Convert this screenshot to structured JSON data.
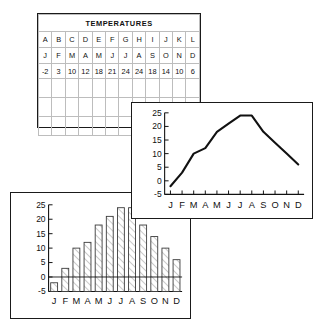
{
  "table": {
    "title": "TEMPERATURES",
    "column_letters": [
      "A",
      "B",
      "C",
      "D",
      "E",
      "F",
      "G",
      "H",
      "I",
      "J",
      "K",
      "L"
    ],
    "month_row": [
      "J",
      "F",
      "M",
      "A",
      "M",
      "J",
      "J",
      "A",
      "S",
      "O",
      "N",
      "D"
    ],
    "value_row": [
      "-2",
      "3",
      "10",
      "12",
      "18",
      "21",
      "24",
      "24",
      "18",
      "14",
      "10",
      "6"
    ],
    "blank_rows": 3
  },
  "chart_data": [
    {
      "type": "line",
      "title": "",
      "categories": [
        "J",
        "F",
        "M",
        "A",
        "M",
        "J",
        "J",
        "A",
        "S",
        "O",
        "N",
        "D"
      ],
      "values": [
        -2,
        3,
        10,
        12,
        18,
        21,
        24,
        24,
        18,
        14,
        10,
        6
      ],
      "xlabel": "",
      "ylabel": "",
      "ylim": [
        -5,
        25
      ],
      "yticks": [
        -5,
        0,
        5,
        10,
        15,
        20,
        25
      ],
      "ytick_labels": [
        "-5",
        "0",
        "5",
        "10",
        "15",
        "20",
        "25"
      ],
      "grid": false,
      "legend": "none",
      "line_color": "#111111"
    },
    {
      "type": "bar",
      "title": "",
      "categories": [
        "J",
        "F",
        "M",
        "A",
        "M",
        "J",
        "J",
        "A",
        "S",
        "O",
        "N",
        "D"
      ],
      "values": [
        -2,
        3,
        10,
        12,
        18,
        21,
        24,
        24,
        18,
        14,
        10,
        6
      ],
      "xlabel": "",
      "ylabel": "",
      "ylim": [
        -5,
        25
      ],
      "yticks": [
        -5,
        0,
        5,
        10,
        15,
        20,
        25
      ],
      "ytick_labels": [
        "-5",
        "0",
        "5",
        "10",
        "15",
        "20",
        "25"
      ],
      "grid": false,
      "legend": "none",
      "bar_fill": "hatched-diagonal",
      "bar_stroke": "#3a3a3a"
    }
  ]
}
